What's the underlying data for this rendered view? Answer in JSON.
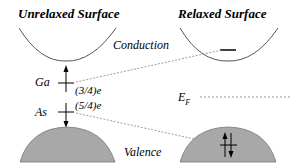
{
  "diagram": {
    "panels": [
      {
        "title": "Unrelaxed Surface"
      },
      {
        "title": "Relaxed Surface"
      }
    ],
    "bands": {
      "conduction": "Conduction",
      "valence": "Valence"
    },
    "fermi_level": {
      "symbol": "E",
      "subscript": "F"
    },
    "atoms": [
      {
        "name": "Ga",
        "charge": "(3/4)e"
      },
      {
        "name": "As",
        "charge": "(5/4)e"
      }
    ],
    "colors": {
      "valence_fill": "#a8a8a8",
      "line": "#555555",
      "dotted": "#888888"
    }
  }
}
